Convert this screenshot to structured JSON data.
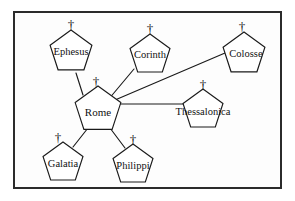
{
  "diagram": {
    "type": "hub-and-spoke network diagram",
    "frame": {
      "x": 14,
      "y": 12,
      "width": 267,
      "height": 176,
      "border_color": "#2b2b2b",
      "background_color": "#fdfdfd"
    },
    "icon": {
      "shape": "pentagon",
      "cross_glyph": "†",
      "cross_icon_name": "cross-icon"
    },
    "colors": {
      "line": "#1a1a1a",
      "node_fill": "#ffffff",
      "node_stroke": "#1a1a1a",
      "text": "#111111"
    },
    "nodes": [
      {
        "id": "ephesus",
        "label": "Ephesus",
        "cx": 71,
        "cy": 52,
        "radius": 22,
        "font_size": 10.5,
        "cross_x": 71,
        "cross_y": 26,
        "cross_size": 13,
        "label_dx": 0,
        "label_dy": 1
      },
      {
        "id": "corinth",
        "label": "Corinth",
        "cx": 150,
        "cy": 55,
        "radius": 21,
        "font_size": 10.5,
        "cross_x": 150,
        "cross_y": 30,
        "cross_size": 13,
        "label_dx": 0,
        "label_dy": 1
      },
      {
        "id": "colosse",
        "label": "Colosse",
        "cx": 244,
        "cy": 54,
        "radius": 22,
        "font_size": 10.5,
        "cross_x": 242,
        "cross_y": 28,
        "cross_size": 13,
        "label_dx": 2,
        "label_dy": 1
      },
      {
        "id": "rome",
        "label": "Rome",
        "cx": 98,
        "cy": 110,
        "radius": 24,
        "font_size": 11,
        "cross_x": 96,
        "cross_y": 83,
        "cross_size": 13,
        "label_dx": 0,
        "label_dy": 3
      },
      {
        "id": "thessalonica",
        "label": "Thessalonica",
        "cx": 203,
        "cy": 110,
        "radius": 21,
        "font_size": 10.5,
        "cross_x": 203,
        "cny": 0,
        "cross_y": 86,
        "cross_size": 13,
        "label_dx": 0,
        "label_dy": 3
      },
      {
        "id": "galatia",
        "label": "Galatia",
        "cx": 63,
        "cy": 163,
        "radius": 21,
        "font_size": 10.5,
        "cross_x": 58,
        "cross_y": 139,
        "cross_size": 13,
        "label_dx": 0,
        "label_dy": 2
      },
      {
        "id": "philippi",
        "label": "Philippi",
        "cx": 133,
        "cy": 165,
        "radius": 21,
        "font_size": 10.5,
        "cross_x": 133,
        "cross_y": 141,
        "cross_size": 13,
        "label_dx": 0,
        "label_dy": 2
      }
    ],
    "edges": [
      {
        "id": "rome-ephesus",
        "from": "rome",
        "to": "ephesus",
        "x1": 83,
        "y1": 95,
        "x2": 76,
        "y2": 73
      },
      {
        "id": "rome-corinth",
        "from": "rome",
        "to": "corinth",
        "x1": 108,
        "y1": 100,
        "x2": 134,
        "y2": 69
      },
      {
        "id": "rome-colosse",
        "from": "rome",
        "to": "colosse",
        "x1": 108,
        "y1": 103,
        "x2": 225,
        "y2": 53
      },
      {
        "id": "rome-thessalonica",
        "from": "rome",
        "to": "thessalonica",
        "x1": 110,
        "y1": 104,
        "x2": 184,
        "y2": 104
      },
      {
        "id": "rome-galatia",
        "from": "rome",
        "to": "galatia",
        "x1": 88,
        "y1": 128,
        "x2": 73,
        "y2": 147
      },
      {
        "id": "rome-philippi",
        "from": "rome",
        "to": "philippi",
        "x1": 110,
        "y1": 128,
        "x2": 125,
        "y2": 148
      }
    ]
  }
}
